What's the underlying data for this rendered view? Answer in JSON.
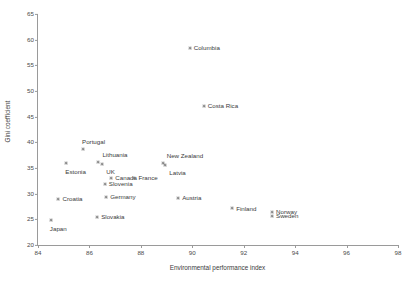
{
  "chart_data": {
    "type": "scatter",
    "title": "",
    "xlabel": "Environmental performance index",
    "ylabel": "Gini coefficient",
    "xlim": [
      84,
      98
    ],
    "ylim": [
      20,
      65
    ],
    "xticks": [
      84,
      86,
      88,
      90,
      92,
      94,
      96,
      98
    ],
    "yticks": [
      20,
      25,
      30,
      35,
      40,
      45,
      50,
      55,
      60,
      65
    ],
    "grid": false,
    "legend": "none",
    "marker_color": "#6f6f6f",
    "points": [
      {
        "label": "Columbia",
        "x": 89.9,
        "y": 58.4,
        "label_pos": "right"
      },
      {
        "label": "Costa Rica",
        "x": 90.45,
        "y": 47.1,
        "label_pos": "right"
      },
      {
        "label": "Portugal",
        "x": 85.75,
        "y": 38.6,
        "label_pos": "above"
      },
      {
        "label": "Lithuania",
        "x": 86.35,
        "y": 36.1,
        "label_pos": "ne"
      },
      {
        "label": "UK",
        "x": 86.5,
        "y": 35.7,
        "label_pos": "se"
      },
      {
        "label": "Estonia",
        "x": 85.1,
        "y": 36.0,
        "label_pos": "below"
      },
      {
        "label": "New Zealand",
        "x": 88.85,
        "y": 36.0,
        "label_pos": "ne"
      },
      {
        "label": "Latvia",
        "x": 88.95,
        "y": 35.6,
        "label_pos": "se"
      },
      {
        "label": "Canada",
        "x": 86.85,
        "y": 33.0,
        "label_pos": "right"
      },
      {
        "label": "France",
        "x": 87.75,
        "y": 33.1,
        "label_pos": "right"
      },
      {
        "label": "Slovenia",
        "x": 86.6,
        "y": 31.9,
        "label_pos": "right"
      },
      {
        "label": "Croatia",
        "x": 84.8,
        "y": 29.0,
        "label_pos": "right"
      },
      {
        "label": "Germany",
        "x": 86.65,
        "y": 29.4,
        "label_pos": "right"
      },
      {
        "label": "Austria",
        "x": 89.45,
        "y": 29.1,
        "label_pos": "right"
      },
      {
        "label": "Finland",
        "x": 91.55,
        "y": 27.1,
        "label_pos": "right"
      },
      {
        "label": "Norway",
        "x": 93.1,
        "y": 26.5,
        "label_pos": "right"
      },
      {
        "label": "Sweden",
        "x": 93.1,
        "y": 25.7,
        "label_pos": "right"
      },
      {
        "label": "Slovakia",
        "x": 86.3,
        "y": 25.5,
        "label_pos": "right"
      },
      {
        "label": "Japan",
        "x": 84.5,
        "y": 24.8,
        "label_pos": "below"
      }
    ]
  }
}
